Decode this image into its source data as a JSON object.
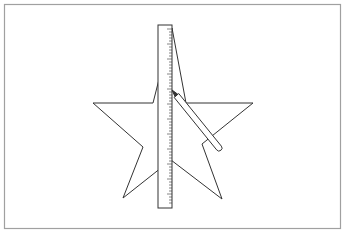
{
  "diagram": {
    "colors": {
      "background": "#ffffff",
      "frame": "#a0a0a0",
      "stroke": "#333333",
      "ruler_fill": "#ffffff"
    },
    "frame": {
      "x": 4.5,
      "y": 4.5,
      "width": 336,
      "height": 224
    },
    "star": {
      "points": "172,28 186,103 253,103 202,144 222,199 171,160 123,198 143,147 93,103 153,103"
    },
    "ruler": {
      "x": 158,
      "y": 25,
      "width": 14,
      "height": 183,
      "tick_count": 60,
      "tick_spacing": 3
    },
    "pencil": {
      "x1": 172,
      "y1": 90,
      "x2": 219,
      "y2": 148,
      "width": 6
    }
  }
}
